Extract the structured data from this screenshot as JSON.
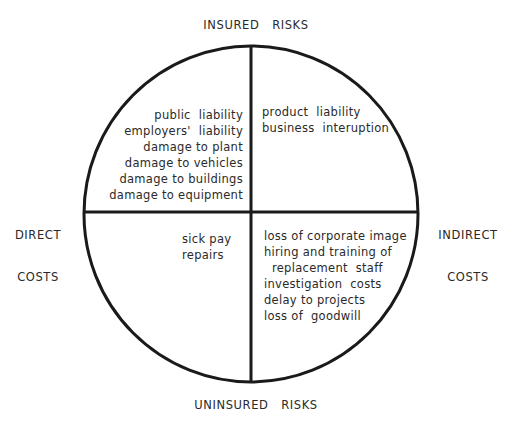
{
  "diagram": {
    "axes": {
      "top": "INSURED   RISKS",
      "bottom": "UNINSURED   RISKS",
      "left": [
        "DIRECT",
        "COSTS"
      ],
      "right": [
        "INDIRECT",
        "COSTS"
      ]
    },
    "quadrants": {
      "insured_direct": [
        "public  liability",
        "employers'  liability",
        "damage to plant",
        "damage to vehicles",
        "damage to buildings",
        "damage to equipment"
      ],
      "insured_indirect": [
        "product  liability",
        "business  interuption"
      ],
      "uninsured_direct": [
        "sick pay",
        "repairs"
      ],
      "uninsured_indirect": [
        "loss of corporate image",
        "hiring and training of",
        "  replacement  staff",
        "investigation  costs",
        "delay to projects",
        "loss of  goodwill"
      ]
    },
    "colors": {
      "line": "#1a1a1a",
      "text": "#2a2a2a",
      "background": "#ffffff"
    }
  }
}
